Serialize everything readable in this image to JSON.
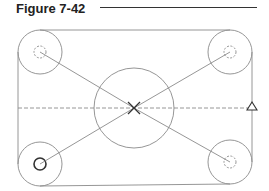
{
  "figure": {
    "title": "Figure 7-42"
  },
  "colors": {
    "line": "#8a8a8a",
    "dark": "#333333",
    "title": "#222222"
  },
  "drawing": {
    "outline": {
      "shape": "rounded-rectangle",
      "x1": 17,
      "y1": 29,
      "x2": 252,
      "y2": 186
    },
    "center_circle": {
      "cx": 134,
      "cy": 108,
      "r": 40
    },
    "corner_bosses": [
      {
        "name": "top-left",
        "cx": 40,
        "cy": 52,
        "r": 22,
        "hole_r": 6,
        "hole_style": "dashed"
      },
      {
        "name": "top-right",
        "cx": 230,
        "cy": 52,
        "r": 22,
        "hole_r": 6,
        "hole_style": "dashed"
      },
      {
        "name": "bottom-left",
        "cx": 40,
        "cy": 164,
        "r": 22,
        "hole_r": 6,
        "hole_style": "solid"
      },
      {
        "name": "bottom-right",
        "cx": 230,
        "cy": 162,
        "r": 22,
        "hole_r": 6,
        "hole_style": "dashed"
      }
    ],
    "centerline": {
      "y": 108,
      "style": "dashed"
    },
    "center_mark": "x-mark",
    "marker": {
      "shape": "triangle",
      "x": 252,
      "y": 108
    }
  }
}
